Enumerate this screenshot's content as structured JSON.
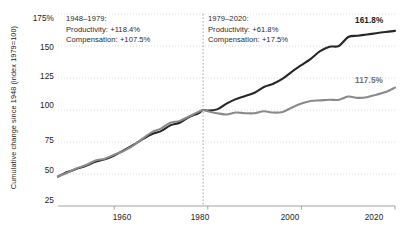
{
  "chart_data": {
    "type": "line",
    "title": "",
    "xlabel": "",
    "ylabel": "Cumulative change since 1948 (index 1979=100)",
    "xlim": [
      1948,
      2020
    ],
    "ylim": [
      25,
      175
    ],
    "grid": true,
    "legend_position": "none",
    "yticks": [
      "175%",
      "150",
      "125",
      "100",
      "75",
      "50",
      "25"
    ],
    "ytick_values": [
      175,
      150,
      125,
      100,
      75,
      50,
      25
    ],
    "xticks": [
      "1960",
      "1980",
      "2000",
      "2020"
    ],
    "xtick_values": [
      1960,
      1980,
      2000,
      2020
    ],
    "divider_year": 1979,
    "series": [
      {
        "name": "Productivity",
        "color": "#262626",
        "end_label": "161.8%",
        "x": [
          1948,
          1950,
          1952,
          1954,
          1956,
          1958,
          1960,
          1962,
          1964,
          1966,
          1968,
          1970,
          1972,
          1974,
          1976,
          1978,
          1979,
          1980,
          1982,
          1984,
          1986,
          1988,
          1990,
          1992,
          1994,
          1996,
          1998,
          2000,
          2002,
          2004,
          2006,
          2008,
          2010,
          2012,
          2014,
          2016,
          2018,
          2020
        ],
        "values": [
          48.0,
          51.5,
          54.0,
          56.5,
          59.5,
          61.5,
          64.5,
          68.5,
          72.5,
          77.0,
          81.0,
          83.5,
          88.0,
          90.0,
          94.5,
          97.5,
          100.0,
          99.5,
          100.5,
          105.0,
          108.5,
          111.0,
          113.5,
          118.0,
          120.5,
          124.5,
          130.0,
          135.0,
          140.0,
          146.0,
          149.5,
          150.0,
          157.0,
          158.0,
          159.0,
          160.0,
          161.0,
          161.8
        ]
      },
      {
        "name": "Compensation",
        "color": "#8a8a8a",
        "end_label": "117.5%",
        "x": [
          1948,
          1950,
          1952,
          1954,
          1956,
          1958,
          1960,
          1962,
          1964,
          1966,
          1968,
          1970,
          1972,
          1974,
          1976,
          1978,
          1979,
          1980,
          1982,
          1984,
          1986,
          1988,
          1990,
          1992,
          1994,
          1996,
          1998,
          2000,
          2002,
          2004,
          2006,
          2008,
          2010,
          2012,
          2014,
          2016,
          2018,
          2020
        ],
        "values": [
          48.0,
          51.0,
          54.5,
          57.0,
          60.5,
          62.0,
          65.0,
          68.0,
          72.0,
          77.5,
          82.5,
          85.5,
          90.0,
          91.5,
          95.0,
          98.5,
          100.0,
          99.0,
          97.5,
          96.5,
          98.0,
          97.5,
          97.5,
          99.0,
          98.0,
          98.5,
          102.0,
          105.0,
          107.0,
          107.5,
          108.0,
          108.0,
          110.5,
          109.5,
          110.0,
          112.0,
          114.0,
          117.5
        ]
      }
    ],
    "annotations": [
      {
        "id": "period-1",
        "period": "1948–1979:",
        "productivity": "Productivity: +118.4%",
        "compensation": "Compensation: +107.5%"
      },
      {
        "id": "period-2",
        "period": "1979–2020:",
        "productivity": "Productivity: +61.8%",
        "compensation": "Compensation: +17.5%"
      }
    ]
  }
}
